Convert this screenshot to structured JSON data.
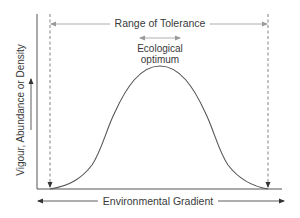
{
  "diagram": {
    "title": "Range of Tolerance",
    "optimum_label": {
      "line1": "Ecological",
      "line2": "optimum"
    },
    "x_axis_label": "Environmental Gradient",
    "y_axis_label": "Vigour, Abundance or Density",
    "colors": {
      "axis": "#555555",
      "curve": "#555555",
      "text": "#3a3a3a",
      "dashed_line": "#666666",
      "range_arrow": "#9a9a9a",
      "background": "#ffffff"
    }
  }
}
